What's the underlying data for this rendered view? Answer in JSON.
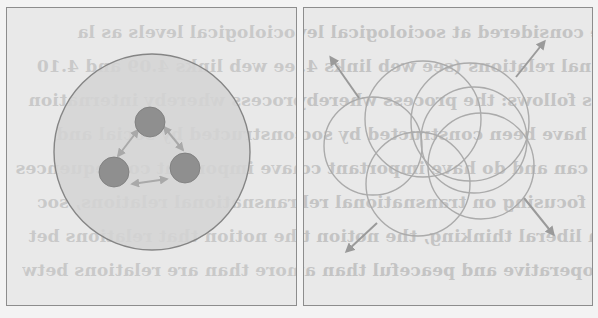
{
  "figure": {
    "panels": [
      {
        "id": "left",
        "description": "Large shaded circle containing three small dark circles connected by double-headed arrows",
        "outer_circle": {
          "cx": 152,
          "cy": 152,
          "r": 98,
          "fill": "#d3d3d3",
          "stroke": "#858585"
        },
        "nodes": [
          {
            "cx": 150,
            "cy": 122,
            "r": 15
          },
          {
            "cx": 114,
            "cy": 172,
            "r": 15
          },
          {
            "cx": 185,
            "cy": 168,
            "r": 15
          }
        ],
        "node_fill": "#8f8f8f",
        "arrow_color": "#a9a9a9"
      },
      {
        "id": "right",
        "description": "Six overlapping outline circles with four arrows pointing outward",
        "circles": [
          {
            "cx": 373,
            "cy": 146,
            "r": 49
          },
          {
            "cx": 423,
            "cy": 119,
            "r": 58
          },
          {
            "cx": 470,
            "cy": 122,
            "r": 59
          },
          {
            "cx": 474,
            "cy": 140,
            "r": 53
          },
          {
            "cx": 481,
            "cy": 166,
            "r": 53
          },
          {
            "cx": 418,
            "cy": 184,
            "r": 52
          }
        ],
        "circle_stroke": "#ababab",
        "arrows": [
          {
            "from": [
              359,
              98
            ],
            "to": [
              331,
              58
            ]
          },
          {
            "from": [
              516,
              77
            ],
            "to": [
              544,
              42
            ]
          },
          {
            "from": [
              377,
              223
            ],
            "to": [
              347,
              251
            ]
          },
          {
            "from": [
              524,
              198
            ],
            "to": [
              553,
              234
            ]
          }
        ],
        "arrow_color": "#9a9a9a"
      }
    ]
  },
  "bleed_through_text": {
    "right": [
      "relations are considered at sociological levels as la",
      "of international relations (see web links 4.09 and 4.10)",
      "conclusion as follows: the process whereby internation",
      "constituents have been constructed by social and political",
      "entities that can and do have important consequences for",
      "(1980: 4). In focusing on transnational relations, soc",
      "is a theme in liberal thinking, the notion that relations bet",
      "and more cooperative and peaceful than are relations betw"
    ],
    "left": [
      "sociological levels as la",
      "see web links 4.09 and 4.10",
      "process whereby internation",
      "constructed by social and",
      "have important consequences",
      "transnational relations, soc",
      "the notion that relations bet",
      "more than are relations betw"
    ]
  }
}
